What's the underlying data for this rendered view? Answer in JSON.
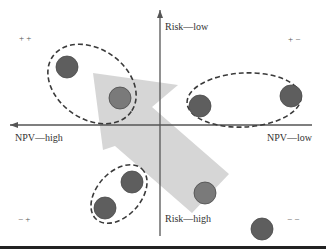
{
  "axes": {
    "y_top_label": "Risk—low",
    "y_bottom_label": "Risk—high",
    "x_left_label": "NPV—high",
    "x_right_label": "NPV—low"
  },
  "quadrant_signs": {
    "top_left": "+ +",
    "top_right": "+ −",
    "bottom_left": "− +",
    "bottom_right": "− −"
  },
  "colors": {
    "axis": "#555555",
    "dot": "#5e5e5e",
    "dot_highlight": "#7a7a7a",
    "arrow": "#d4d4d4",
    "dash": "#3a3a3a",
    "bottom_rule": "#222222"
  },
  "dots": [
    {
      "cx": 67,
      "cy": 67,
      "r": 11
    },
    {
      "cx": 120,
      "cy": 98,
      "r": 11,
      "highlight": true
    },
    {
      "cx": 200,
      "cy": 106,
      "r": 11
    },
    {
      "cx": 291,
      "cy": 96,
      "r": 11
    },
    {
      "cx": 132,
      "cy": 182,
      "r": 11
    },
    {
      "cx": 105,
      "cy": 208,
      "r": 11
    },
    {
      "cx": 205,
      "cy": 193,
      "r": 11,
      "highlight": true
    },
    {
      "cx": 262,
      "cy": 229,
      "r": 11
    }
  ],
  "clusters": [
    {
      "cx": 92,
      "cy": 84,
      "rx": 48,
      "ry": 35,
      "rotate": 35
    },
    {
      "cx": 244,
      "cy": 100,
      "rx": 57,
      "ry": 27,
      "rotate": -3
    },
    {
      "cx": 119,
      "cy": 194,
      "rx": 34,
      "ry": 22,
      "rotate": -48
    }
  ]
}
